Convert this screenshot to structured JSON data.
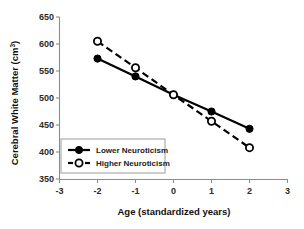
{
  "chart_data": {
    "type": "line",
    "title": "",
    "xlabel": "Age (standardized years)",
    "ylabel": "Cerebral White Matter (cm",
    "ylabel_superscript": "3",
    "ylabel_suffix": ")",
    "x": [
      -2,
      -1,
      0,
      1,
      2
    ],
    "xlim": [
      -3,
      3
    ],
    "ylim": [
      350,
      650
    ],
    "xticks": [
      -3,
      -2,
      -1,
      0,
      1,
      2,
      3
    ],
    "xtick_labels": [
      "-3",
      "-2",
      "-1",
      "0",
      "1",
      "2",
      "3"
    ],
    "yticks": [
      350,
      400,
      450,
      500,
      550,
      600,
      650
    ],
    "ytick_labels": [
      "350",
      "400",
      "450",
      "500",
      "550",
      "600",
      "650"
    ],
    "grid": false,
    "legend_position": "lower-left",
    "series": [
      {
        "name": "Lower  Neuroticism",
        "values": [
          573,
          540,
          506,
          475,
          443
        ],
        "line_style": "solid",
        "marker": "filled-circle",
        "color": "#000000"
      },
      {
        "name": "Higher Neuroticism",
        "values": [
          605,
          556,
          506,
          457,
          408
        ],
        "line_style": "dashed",
        "marker": "open-circle",
        "color": "#000000"
      }
    ]
  }
}
